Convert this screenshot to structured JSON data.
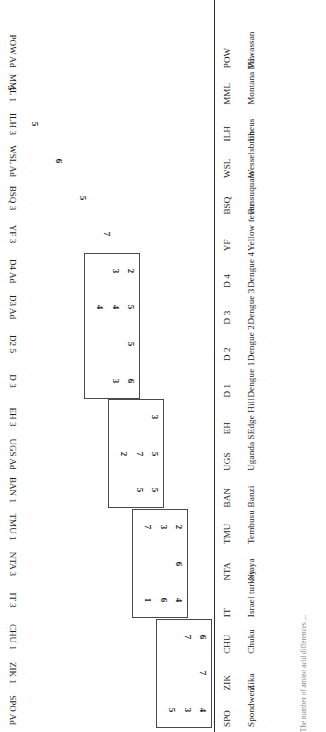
{
  "figure": {
    "type": "matrix",
    "caption": "The number of amino acid differences ..."
  },
  "rows": [
    {
      "name": "Spondweni",
      "abbr": "SPO"
    },
    {
      "name": "Zika",
      "abbr": "ZIK"
    },
    {
      "name": "Chuku",
      "abbr": "CHU"
    },
    {
      "name": "Israel turkey",
      "abbr": "IT"
    },
    {
      "name": "Ntaya",
      "abbr": "NTA"
    },
    {
      "name": "Tembusu",
      "abbr": "TMU"
    },
    {
      "name": "Banzi",
      "abbr": "BAN"
    },
    {
      "name": "Uganda S",
      "abbr": "UGS"
    },
    {
      "name": "Edge Hill",
      "abbr": "EH"
    },
    {
      "name": "Dengue 1",
      "abbr": "D 1"
    },
    {
      "name": "Dengue 2",
      "abbr": "D 2"
    },
    {
      "name": "Dengue 3",
      "abbr": "D 3"
    },
    {
      "name": "Dengue 4",
      "abbr": "D 4"
    },
    {
      "name": "Yellow fever",
      "abbr": "YF"
    },
    {
      "name": "Bussuquara",
      "abbr": "BSQ"
    },
    {
      "name": "Wesselsbron",
      "abbr": "WSL"
    },
    {
      "name": "Ilheus",
      "abbr": "ILH"
    },
    {
      "name": "Montana ML",
      "abbr": "MML"
    },
    {
      "name": "Powassan",
      "abbr": "POW"
    }
  ],
  "columns": [
    "SPO Ad",
    "ZIK 1",
    "CHU 1",
    "IT 3",
    "NTA 3",
    "TMU 1",
    "BAN 1",
    "UGS Ad",
    "EH 3",
    "D 3",
    "D2 5",
    "D3 Ad",
    "D4 Ad",
    "YF 3",
    "BSQ 3",
    "WSL Ad",
    "ILH 3",
    "MML 1",
    "POW Ad"
  ],
  "chart_data": {
    "type": "table",
    "title": "",
    "xlabel": "",
    "ylabel": "",
    "categories": [
      "SPO Ad",
      "ZIK 1",
      "CHU 1",
      "IT 3",
      "NTA 3",
      "TMU 1",
      "BAN 1",
      "UGS Ad",
      "EH 3",
      "D 3",
      "D2 5",
      "D3 Ad",
      "D4 Ad",
      "YF 3",
      "BSQ 3",
      "WSL Ad",
      "ILH 3",
      "MML 1",
      "POW Ad"
    ],
    "cells": [
      {
        "col": "SPO Ad",
        "values": [
          "4",
          "3",
          "5"
        ]
      },
      {
        "col": "ZIK 1",
        "values": [
          "7"
        ]
      },
      {
        "col": "CHU 1",
        "values": [
          "6",
          "7"
        ]
      },
      {
        "col": "IT 3",
        "values": [
          "4",
          "6",
          "1"
        ]
      },
      {
        "col": "NTA 3",
        "values": [
          "6"
        ]
      },
      {
        "col": "TMU 1",
        "values": [
          "2",
          "3",
          "7"
        ]
      },
      {
        "col": "BAN 1",
        "values": [
          "5",
          "5"
        ]
      },
      {
        "col": "UGS Ad",
        "values": [
          "5",
          "7",
          "2"
        ]
      },
      {
        "col": "EH 3",
        "values": [
          "3"
        ]
      },
      {
        "col": "D 3",
        "values": [
          "6",
          "3"
        ]
      },
      {
        "col": "D2 5",
        "values": [
          "5"
        ]
      },
      {
        "col": "D3 Ad",
        "values": [
          "5",
          "4",
          "4"
        ]
      },
      {
        "col": "D4 Ad",
        "values": [
          "2",
          "3"
        ]
      },
      {
        "col": "YF 3",
        "values": [
          "7"
        ]
      },
      {
        "col": "BSQ 3",
        "values": [
          "5"
        ]
      },
      {
        "col": "WSL Ad",
        "values": [
          "6"
        ]
      },
      {
        "col": "ILH 3",
        "values": [
          "5"
        ]
      },
      {
        "col": "MML 1",
        "values": [
          "5"
        ]
      },
      {
        "col": "POW Ad",
        "values": [
          "6"
        ]
      }
    ],
    "blocks": [
      {
        "name": "spondweni-group",
        "columns": [
          "SPO Ad",
          "ZIK 1",
          "CHU 1"
        ]
      },
      {
        "name": "ntaya-group",
        "columns": [
          "IT 3",
          "NTA 3",
          "TMU 1"
        ]
      },
      {
        "name": "banzi-group",
        "columns": [
          "BAN 1",
          "UGS Ad",
          "EH 3"
        ]
      },
      {
        "name": "dengue-group",
        "columns": [
          "D 3",
          "D2 5",
          "D3 Ad",
          "D4 Ad"
        ]
      }
    ],
    "grid": false,
    "legend": "none"
  },
  "cellmap": {
    "c0": [
      "4",
      "3",
      "5"
    ],
    "c1": [
      "7"
    ],
    "c2": [
      "6",
      "7"
    ],
    "c3": [
      "4",
      "6",
      "1"
    ],
    "c4": [
      "6"
    ],
    "c5": [
      "2",
      "3",
      "7"
    ],
    "c6": [
      "5",
      "5"
    ],
    "c7": [
      "5",
      "7",
      "2"
    ],
    "c8": [
      "3"
    ],
    "c9": [
      "6",
      "3"
    ],
    "c10": [
      "5"
    ],
    "c11": [
      "5",
      "4",
      "4"
    ],
    "c12": [
      "2",
      "3"
    ],
    "c13": [
      "7"
    ],
    "c14": [
      "5"
    ],
    "c15": [
      "6"
    ],
    "c16": [
      "5"
    ],
    "c17": [
      "5"
    ],
    "c18": [
      "6"
    ]
  },
  "colors": {
    "ink": "#1a1a1a",
    "rule": "#2b2b2b",
    "box": "#4a4a4a",
    "caption": "#8a8a8a"
  }
}
